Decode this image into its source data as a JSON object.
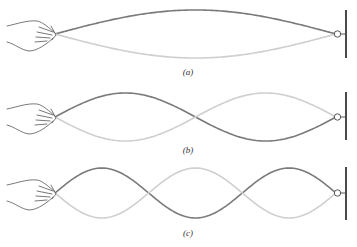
{
  "figure": {
    "colors": {
      "envelope_dark": "#7a7a7a",
      "envelope_light": "#cfcfcf",
      "wall": "#4a4a4a"
    },
    "panels": [
      {
        "id": "a",
        "caption": "(a)",
        "loops": 1
      },
      {
        "id": "b",
        "caption": "(b)",
        "loops": 2
      },
      {
        "id": "c",
        "caption": "(c)",
        "loops": 3
      }
    ]
  }
}
